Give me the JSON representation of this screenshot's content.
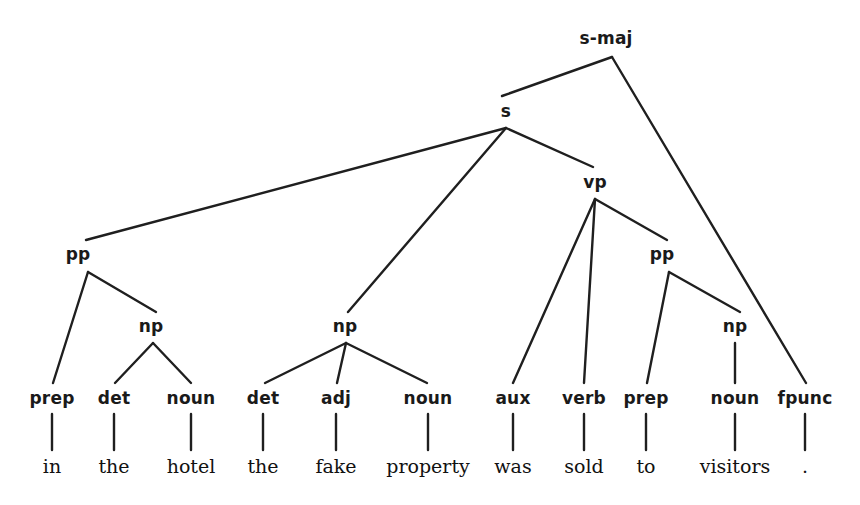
{
  "diagram": {
    "kind": "constituency-parse-tree",
    "sentence": "in the hotel the fake property was sold to visitors .",
    "line_color": "#1f1f1f",
    "text_color": "#1a1a1a",
    "background": "#ffffff"
  },
  "nodes": [
    {
      "id": "s-maj",
      "label": "s-maj",
      "x": 606,
      "y": 38,
      "apex_x": 612,
      "apex_y": 57
    },
    {
      "id": "s",
      "label": "s",
      "x": 506,
      "y": 111,
      "apex_x": 506,
      "apex_y": 128
    },
    {
      "id": "vp",
      "label": "vp",
      "x": 595,
      "y": 182,
      "apex_x": 595,
      "apex_y": 199
    },
    {
      "id": "pp1",
      "label": "pp",
      "x": 78,
      "y": 254,
      "apex_x": 88,
      "apex_y": 272
    },
    {
      "id": "pp2",
      "label": "pp",
      "x": 662,
      "y": 254,
      "apex_x": 669,
      "apex_y": 272
    },
    {
      "id": "np1",
      "label": "np",
      "x": 151,
      "y": 326,
      "apex_x": 153,
      "apex_y": 343
    },
    {
      "id": "np2",
      "label": "np",
      "x": 345,
      "y": 326,
      "apex_x": 346,
      "apex_y": 343
    },
    {
      "id": "np3",
      "label": "np",
      "x": 735,
      "y": 326,
      "apex_x": 735,
      "apex_y": 343
    }
  ],
  "pos_tags": [
    {
      "id": "prep1",
      "label": "prep",
      "x": 52,
      "y": 398
    },
    {
      "id": "det1",
      "label": "det",
      "x": 114,
      "y": 398
    },
    {
      "id": "noun1",
      "label": "noun",
      "x": 191,
      "y": 398
    },
    {
      "id": "det2",
      "label": "det",
      "x": 263,
      "y": 398
    },
    {
      "id": "adj1",
      "label": "adj",
      "x": 336,
      "y": 398
    },
    {
      "id": "noun2",
      "label": "noun",
      "x": 428,
      "y": 398
    },
    {
      "id": "aux1",
      "label": "aux",
      "x": 513,
      "y": 398
    },
    {
      "id": "verb1",
      "label": "verb",
      "x": 584,
      "y": 398
    },
    {
      "id": "prep2",
      "label": "prep",
      "x": 646,
      "y": 398
    },
    {
      "id": "noun3",
      "label": "noun",
      "x": 735,
      "y": 398
    },
    {
      "id": "fpunc",
      "label": "fpunc",
      "x": 805,
      "y": 398
    }
  ],
  "words": [
    {
      "id": "w-in",
      "label": "in",
      "x": 52,
      "y": 466
    },
    {
      "id": "w-the-1",
      "label": "the",
      "x": 114,
      "y": 466
    },
    {
      "id": "w-hotel",
      "label": "hotel",
      "x": 191,
      "y": 466
    },
    {
      "id": "w-the-2",
      "label": "the",
      "x": 263,
      "y": 466
    },
    {
      "id": "w-fake",
      "label": "fake",
      "x": 336,
      "y": 466
    },
    {
      "id": "w-property",
      "label": "property",
      "x": 428,
      "y": 466
    },
    {
      "id": "w-was",
      "label": "was",
      "x": 513,
      "y": 466
    },
    {
      "id": "w-sold",
      "label": "sold",
      "x": 584,
      "y": 466
    },
    {
      "id": "w-to",
      "label": "to",
      "x": 646,
      "y": 466
    },
    {
      "id": "w-visitors",
      "label": "visitors",
      "x": 735,
      "y": 466
    },
    {
      "id": "w-period",
      "label": ".",
      "x": 805,
      "y": 466
    }
  ],
  "edges": [
    {
      "name": "edge-smaj-to-s",
      "x1": 612,
      "y1": 57,
      "x2": 502,
      "y2": 96
    },
    {
      "name": "edge-smaj-to-fpunc",
      "x1": 612,
      "y1": 57,
      "x2": 806,
      "y2": 383
    },
    {
      "name": "edge-s-to-pp1",
      "x1": 506,
      "y1": 128,
      "x2": 86,
      "y2": 240
    },
    {
      "name": "edge-s-to-np2",
      "x1": 506,
      "y1": 128,
      "x2": 348,
      "y2": 312
    },
    {
      "name": "edge-s-to-vp",
      "x1": 506,
      "y1": 128,
      "x2": 593,
      "y2": 167
    },
    {
      "name": "edge-vp-to-aux",
      "x1": 595,
      "y1": 199,
      "x2": 513,
      "y2": 383
    },
    {
      "name": "edge-vp-to-verb",
      "x1": 595,
      "y1": 199,
      "x2": 584,
      "y2": 383
    },
    {
      "name": "edge-vp-to-pp2",
      "x1": 595,
      "y1": 199,
      "x2": 667,
      "y2": 240
    },
    {
      "name": "edge-pp1-to-prep1",
      "x1": 88,
      "y1": 272,
      "x2": 53,
      "y2": 383
    },
    {
      "name": "edge-pp1-to-np1",
      "x1": 88,
      "y1": 272,
      "x2": 156,
      "y2": 312
    },
    {
      "name": "edge-np1-to-det1",
      "x1": 153,
      "y1": 343,
      "x2": 115,
      "y2": 383
    },
    {
      "name": "edge-np1-to-noun1",
      "x1": 153,
      "y1": 343,
      "x2": 191,
      "y2": 383
    },
    {
      "name": "edge-np2-to-det2",
      "x1": 346,
      "y1": 343,
      "x2": 265,
      "y2": 383
    },
    {
      "name": "edge-np2-to-adj1",
      "x1": 346,
      "y1": 343,
      "x2": 337,
      "y2": 383
    },
    {
      "name": "edge-np2-to-noun2",
      "x1": 346,
      "y1": 343,
      "x2": 427,
      "y2": 383
    },
    {
      "name": "edge-pp2-to-prep2",
      "x1": 669,
      "y1": 272,
      "x2": 647,
      "y2": 383
    },
    {
      "name": "edge-pp2-to-np3",
      "x1": 669,
      "y1": 272,
      "x2": 740,
      "y2": 312
    },
    {
      "name": "edge-np3-to-noun3",
      "x1": 735,
      "y1": 343,
      "x2": 735,
      "y2": 383
    },
    {
      "name": "edge-prep1-to-in",
      "x1": 52,
      "y1": 414,
      "x2": 52,
      "y2": 450
    },
    {
      "name": "edge-det1-to-the",
      "x1": 114,
      "y1": 414,
      "x2": 114,
      "y2": 450
    },
    {
      "name": "edge-noun1-to-hotel",
      "x1": 191,
      "y1": 414,
      "x2": 191,
      "y2": 450
    },
    {
      "name": "edge-det2-to-the",
      "x1": 263,
      "y1": 414,
      "x2": 263,
      "y2": 450
    },
    {
      "name": "edge-adj1-to-fake",
      "x1": 336,
      "y1": 414,
      "x2": 336,
      "y2": 450
    },
    {
      "name": "edge-noun2-to-prop",
      "x1": 428,
      "y1": 414,
      "x2": 428,
      "y2": 450
    },
    {
      "name": "edge-aux1-to-was",
      "x1": 513,
      "y1": 414,
      "x2": 513,
      "y2": 450
    },
    {
      "name": "edge-verb1-to-sold",
      "x1": 584,
      "y1": 414,
      "x2": 584,
      "y2": 450
    },
    {
      "name": "edge-prep2-to-to",
      "x1": 646,
      "y1": 414,
      "x2": 646,
      "y2": 450
    },
    {
      "name": "edge-noun3-to-visit",
      "x1": 735,
      "y1": 414,
      "x2": 735,
      "y2": 450
    },
    {
      "name": "edge-fpunc-to-period",
      "x1": 805,
      "y1": 414,
      "x2": 805,
      "y2": 450
    }
  ]
}
